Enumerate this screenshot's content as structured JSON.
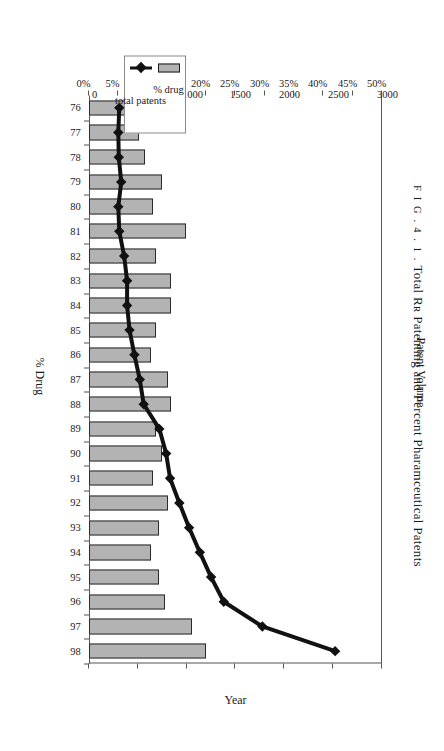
{
  "figure": {
    "fig_word": "F I G .",
    "fig_number": "4 . 1 .",
    "title": "Total Rʀ Patenting and Percent Pharamceutical Patents",
    "full_caption": "F I G .  4 . 1 .  Total Rʀ Patenting and Percent Pharamceutical Patents"
  },
  "legend": {
    "position": "inner-left",
    "items": [
      {
        "label": "% drug",
        "marker": "bar-swatch",
        "color": "#b3b3b3"
      },
      {
        "label": "total patents",
        "marker": "line-diamond",
        "color": "#111111"
      }
    ]
  },
  "axes": {
    "volume": {
      "title": "Patent Volume",
      "ticks": [
        "0",
        "500",
        "1000",
        "1500",
        "2000",
        "2500",
        "3000"
      ],
      "min": 0,
      "max": 3000
    },
    "percent": {
      "title": "% Drug",
      "ticks": [
        "0%",
        "5%",
        "10%",
        "15%",
        "20%",
        "25%",
        "30%",
        "35%",
        "40%",
        "45%",
        "50%"
      ],
      "min": 0,
      "max": 50
    },
    "category": {
      "title": "Year",
      "ticks": [
        "76",
        "77",
        "78",
        "79",
        "80",
        "81",
        "82",
        "83",
        "84",
        "85",
        "86",
        "87",
        "88",
        "89",
        "90",
        "91",
        "92",
        "93",
        "94",
        "95",
        "96",
        "97",
        "98"
      ]
    }
  },
  "colors": {
    "bar_fill": "#b3b3b3",
    "bar_stroke": "#2b2b2b",
    "line": "#111111",
    "axis": "#555555",
    "background": "#ffffff"
  },
  "chart_data": {
    "type": "bar",
    "title": "F I G .  4 . 1 .  Total Rʀ Patenting and Percent Pharamceutical Patents",
    "orientation": "horizontal-bars-with-overlaid-line",
    "categories": [
      "76",
      "77",
      "78",
      "79",
      "80",
      "81",
      "82",
      "83",
      "84",
      "85",
      "86",
      "87",
      "88",
      "89",
      "90",
      "91",
      "92",
      "93",
      "94",
      "95",
      "96",
      "97",
      "98"
    ],
    "xlabel": "Year",
    "ylabel": "% Drug",
    "y2label": "Patent Volume",
    "ylim": [
      0,
      50
    ],
    "y2lim": [
      0,
      3000
    ],
    "grid": false,
    "legend_position": "inner-left",
    "series": [
      {
        "name": "% drug",
        "axis": "percent",
        "kind": "bar",
        "unit": "%",
        "values": [
          9.5,
          8.5,
          9.5,
          12.5,
          11.0,
          16.5,
          11.5,
          14.0,
          14.0,
          11.5,
          10.5,
          13.5,
          14.0,
          11.5,
          12.5,
          11.0,
          13.5,
          12.0,
          10.5,
          12.0,
          13.0,
          17.5,
          20.0
        ]
      },
      {
        "name": "total patents",
        "axis": "volume",
        "kind": "line",
        "marker": "diamond",
        "values": [
          310,
          300,
          305,
          330,
          300,
          310,
          360,
          390,
          390,
          415,
          465,
          520,
          560,
          720,
          790,
          830,
          925,
          1025,
          1135,
          1250,
          1380,
          1775,
          2520
        ]
      }
    ]
  }
}
